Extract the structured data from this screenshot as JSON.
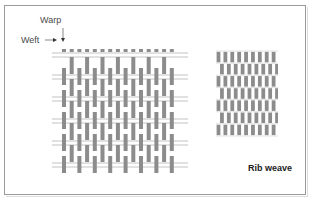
{
  "diagram": {
    "labels": {
      "warp": "Warp",
      "weft": "Weft"
    },
    "caption": "Rib weave",
    "colors": {
      "frame": "#9a9a9a",
      "yarn": "#8c8c8c",
      "weft_line": "#b4b4b4",
      "text": "#4a4a4a"
    },
    "left_weave": {
      "description": "Open structure view of rib weave showing interlacing of warp and weft yarns",
      "warp_columns": 15,
      "weft_rows": 12
    },
    "right_weave": {
      "description": "Compact fabric surface view of rib weave",
      "warp_columns": 9,
      "rib_rows": 7
    }
  }
}
